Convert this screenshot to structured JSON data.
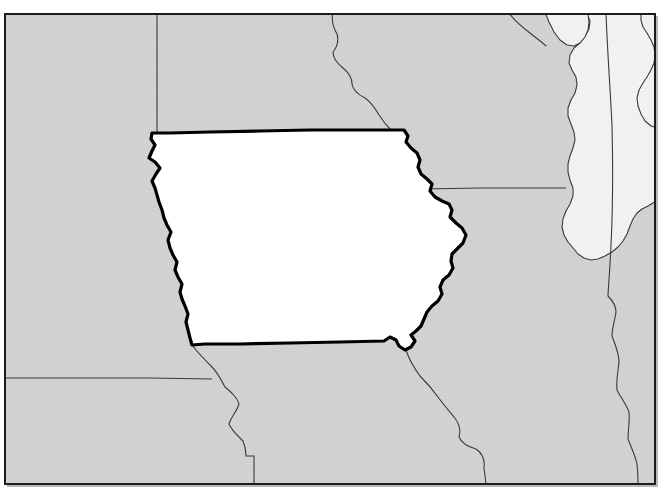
{
  "map": {
    "title": "Iowa locator map",
    "type": "state-locator-map",
    "region": "Upper Midwest, United States",
    "projection_note": "rectangular frame crop",
    "frame": {
      "x": 4,
      "y": 13,
      "width": 652,
      "height": 472,
      "stroke_color": "#1c1c1c",
      "stroke_width": 2,
      "shadow_color": "#b9b9b9"
    },
    "colors": {
      "page_background": "#ffffff",
      "land_fill": "#d2d2d2",
      "land_fill_texture": "#cbcbcb",
      "highlight_fill": "#ffffff",
      "water_fill": "#f2f2f2",
      "state_border": "#3a3a3a",
      "highlight_border": "#000000",
      "water_border": "#3a3a3a"
    },
    "stroke_widths": {
      "state_border": 1.1,
      "highlight_border": 3.2,
      "water_border": 1.1
    },
    "highlighted_state": {
      "name": "Iowa",
      "fill": "#ffffff",
      "outline": "#000000"
    },
    "neighbor_states": [
      {
        "name": "South Dakota",
        "fill": "#d2d2d2"
      },
      {
        "name": "Minnesota",
        "fill": "#d2d2d2"
      },
      {
        "name": "Wisconsin",
        "fill": "#d2d2d2"
      },
      {
        "name": "Nebraska",
        "fill": "#d2d2d2"
      },
      {
        "name": "Illinois",
        "fill": "#d2d2d2"
      },
      {
        "name": "Kansas",
        "fill": "#d2d2d2"
      },
      {
        "name": "Missouri",
        "fill": "#d2d2d2"
      },
      {
        "name": "Michigan",
        "fill": "#d2d2d2"
      },
      {
        "name": "Indiana",
        "fill": "#d2d2d2"
      }
    ],
    "water_bodies": [
      {
        "name": "Lake Michigan",
        "fill": "#f2f2f2"
      }
    ],
    "labels": [],
    "legend": null
  },
  "geometry": {
    "iowa_outline": "M 152,133 L 157,133 L 200,132 L 250,131 L 300,130 L 350,130 L 390,130 L 404,130 L 408,135 L 407,141 L 412,147 L 417,152 L 420,159 L 419,166 L 421,173 L 427,178 L 432,183 L 430,190 L 434,196 L 441,200 L 448,203 L 452,209 L 450,216 L 455,222 L 462,227 L 466,234 L 464,242 L 458,248 L 452,253 L 451,260 L 453,267 L 450,274 L 444,279 L 440,286 L 442,293 L 439,300 L 433,305 L 428,311 L 425,318 L 422,325 L 417,330 L 412,334 L 415,340 L 412,346 L 406,349 L 400,346 L 397,340 L 391,337 L 385,340 L 340,341 L 300,342 L 250,343 L 210,344 L 192,344 L 190,338 L 188,330 L 186,322 L 188,314 L 186,306 L 183,299 L 180,292 L 182,284 L 179,277 L 175,270 L 177,262 L 174,255 L 170,248 L 168,240 L 171,232 L 168,225 L 164,218 L 162,210 L 160,202 L 157,195 L 155,188 L 152,181 L 156,174 L 160,168 L 156,162 L 150,158 L 152,151 L 155,145 L 151,139 Z",
    "northern_states_divider_sd_mn": "M 157,14 L 157,133",
    "mn_wi_river": "M 333,14 L 331,21 L 334,29 L 338,36 L 337,44 L 333,51 L 334,58 L 339,64 L 344,69 L 349,73 L 352,79 L 351,86 L 354,92 L 360,96 L 366,99 L 371,104 L 375,110 L 379,116 L 383,122 L 387,127 L 391,130",
    "wi_il_border": "M 422,187 L 470,187 L 520,188 L 560,189 L 574,189",
    "ne_ks_border": "M 5,378 L 60,378 L 120,378 L 180,379 L 210,379",
    "ne_mo_river": "M 192,344 L 199,352 L 205,359 L 212,366 L 218,372 L 221,379 L 226,386 L 232,391 L 237,396 L 239,403 L 236,410 L 231,416 L 229,423 L 232,430 L 238,435 L 243,440 L 246,447 L 246,455 L 246,465 L 246,476 L 246,485",
    "ks_mo_border": "M 246,455 L 253,455 L 253,485",
    "mo_il_river": "M 406,349 L 409,357 L 413,366 L 419,374 L 426,381 L 432,388 L 437,395 L 441,402 L 446,409 L 452,415 L 457,421 L 460,428 L 458,435 L 461,442 L 468,446 L 475,448 L 481,452 L 484,459 L 483,467 L 484,475 L 485,485",
    "il_in_border": "M 606,14 L 607,40 L 609,70 L 611,100 L 612,130 L 613,160 L 613,190 L 612,220 L 611,250 L 610,275 L 608,295 L 611,300 L 614,303 L 616,307 L 616,312 L 615,318 L 613,325 L 612,333 L 614,340 L 617,347 L 619,355 L 619,363 L 617,371 L 616,380 L 617,388 L 620,395 L 624,400 L 628,406 L 630,412 L 630,420 L 628,428 L 627,436 L 628,444 L 631,451 L 634,458 L 636,465 L 637,473 L 637,485",
    "mi_wi_strip": "M 547,14 L 550,22 L 554,31 L 559,38 L 564,43 L 570,45 L 577,44 L 582,40 L 586,34 L 589,27 L 589,19 L 588,14",
    "lake_michigan": "M 587,14 L 590,21 L 589,29 L 585,36 L 580,43 L 574,48 L 570,55 L 569,63 L 572,70 L 576,77 L 577,85 L 575,93 L 571,100 L 568,108 L 568,116 L 571,124 L 574,132 L 575,140 L 573,148 L 570,156 L 568,164 L 568,172 L 570,180 L 573,188 L 573,196 L 570,204 L 566,211 L 563,219 L 562,227 L 564,235 L 568,242 L 573,248 L 578,254 L 584,258 L 591,260 L 598,259 L 605,256 L 612,252 L 618,247 L 623,241 L 627,234 L 630,226 L 633,219 L 637,213 L 642,209 L 648,206 L 653,203 L 656,199 L 656,14 Z",
    "lake_michigan_east_shore": "M 656,125 L 651,124 L 646,120 L 642,114 L 639,107 L 638,99 L 639,91 L 642,84 L 646,78 L 650,72 L 653,65 L 654,57 L 653,49 L 650,42 L 646,36 L 642,30 L 640,23 L 640,15",
    "green_bay_inlet": "M 547,14 L 551,23 L 556,32 L 562,39 L 568,43 L 574,44 L 579,41 L 583,35 L 585,28"
  },
  "graticule": {
    "visible": false
  },
  "attribution": null
}
